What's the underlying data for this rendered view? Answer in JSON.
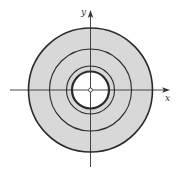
{
  "figure": {
    "colors": {
      "fill": "#d8d8d8",
      "stroke": "#2a2a2a",
      "axis": "#333333",
      "hole": "#ffffff"
    },
    "axes": {
      "x_label": "x",
      "y_label": "y"
    },
    "center": {
      "cx": 90.5,
      "cy": 90
    },
    "circles": [
      {
        "name": "outer-boundary",
        "r": 62,
        "stroke_width": 1.6
      },
      {
        "name": "middle-circle",
        "r": 41,
        "stroke_width": 1.1
      },
      {
        "name": "third-circle",
        "r": 24,
        "stroke_width": 1.1
      },
      {
        "name": "inner-boundary",
        "r": 18.5,
        "stroke_width": 2.2
      }
    ],
    "origin_marker": {
      "r": 2
    }
  }
}
